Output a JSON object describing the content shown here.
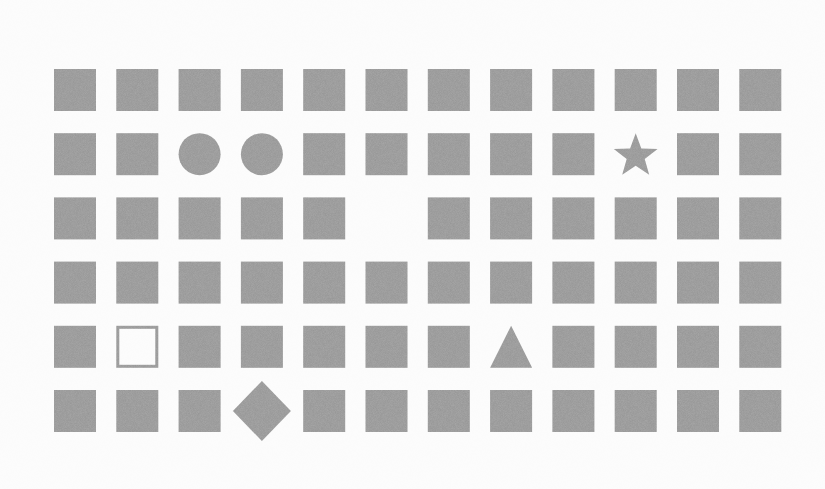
{
  "puzzle": {
    "type": "odd-one-out-grid",
    "rows": 6,
    "columns": 12,
    "cell_size": 42,
    "origin": {
      "x": 54,
      "y": 69
    },
    "column_pitch": 62.3,
    "row_pitch": 64.2,
    "colors": {
      "background": "#fdfdfd",
      "shape_fill": "#a9a9a9",
      "hollow_border": "#a9a9a9"
    },
    "default_shape": "square",
    "grid": [
      [
        "square",
        "square",
        "square",
        "square",
        "square",
        "square",
        "square",
        "square",
        "square",
        "square",
        "square",
        "square"
      ],
      [
        "square",
        "square",
        "circle",
        "circle",
        "square",
        "square",
        "square",
        "square",
        "square",
        "star",
        "square",
        "square"
      ],
      [
        "square",
        "square",
        "square",
        "square",
        "square",
        "empty",
        "square",
        "square",
        "square",
        "square",
        "square",
        "square"
      ],
      [
        "square",
        "square",
        "square",
        "square",
        "square",
        "square",
        "square",
        "square",
        "square",
        "square",
        "square",
        "square"
      ],
      [
        "square",
        "hollow-square",
        "square",
        "square",
        "square",
        "square",
        "square",
        "triangle",
        "square",
        "square",
        "square",
        "square"
      ],
      [
        "square",
        "square",
        "square",
        "diamond",
        "square",
        "square",
        "square",
        "square",
        "square",
        "square",
        "square",
        "square"
      ]
    ],
    "anomalies": [
      {
        "row": 2,
        "col": 3,
        "shape": "circle"
      },
      {
        "row": 2,
        "col": 4,
        "shape": "circle"
      },
      {
        "row": 2,
        "col": 10,
        "shape": "star"
      },
      {
        "row": 3,
        "col": 6,
        "shape": "empty"
      },
      {
        "row": 5,
        "col": 2,
        "shape": "hollow-square"
      },
      {
        "row": 5,
        "col": 8,
        "shape": "triangle"
      },
      {
        "row": 6,
        "col": 4,
        "shape": "diamond"
      }
    ]
  }
}
